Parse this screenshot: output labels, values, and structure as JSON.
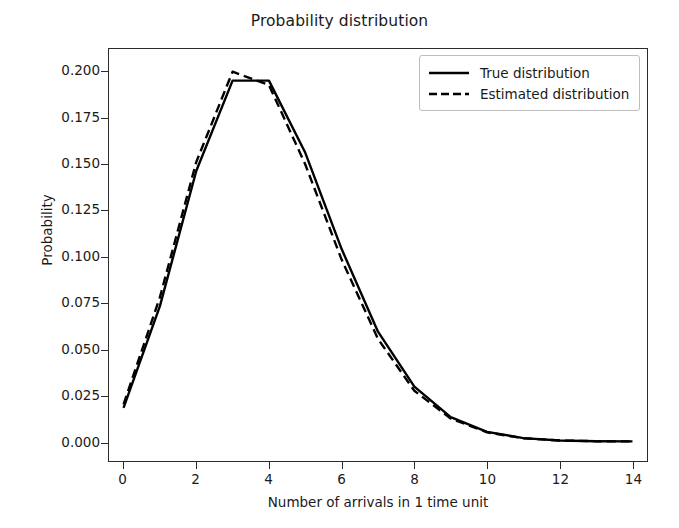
{
  "chart_data": {
    "type": "line",
    "title": "Probability distribution",
    "xlabel": "Number of arrivals in 1 time unit",
    "ylabel": "Probability",
    "xlim": [
      -0.4,
      14.4
    ],
    "ylim": [
      -0.0105,
      0.2125
    ],
    "grid": false,
    "legend_position": "upper right",
    "xticks": [
      0,
      2,
      4,
      6,
      8,
      10,
      12,
      14
    ],
    "xtick_labels": [
      "0",
      "2",
      "4",
      "6",
      "8",
      "10",
      "12",
      "14"
    ],
    "yticks": [
      0.0,
      0.025,
      0.05,
      0.075,
      0.1,
      0.125,
      0.15,
      0.175,
      0.2
    ],
    "ytick_labels": [
      "0.000",
      "0.025",
      "0.050",
      "0.075",
      "0.100",
      "0.125",
      "0.150",
      "0.175",
      "0.200"
    ],
    "x": [
      0,
      1,
      2,
      3,
      4,
      5,
      6,
      7,
      8,
      9,
      10,
      11,
      12,
      13,
      14
    ],
    "series": [
      {
        "name": "True distribution",
        "style": "solid",
        "color": "#000000",
        "values": [
          0.0183,
          0.0733,
          0.1465,
          0.1954,
          0.1954,
          0.1563,
          0.1042,
          0.0595,
          0.0298,
          0.0132,
          0.0053,
          0.0019,
          0.0006,
          0.0002,
          0.0001
        ]
      },
      {
        "name": "Estimated distribution",
        "style": "dashed",
        "color": "#000000",
        "values": [
          0.0202,
          0.0781,
          0.1513,
          0.2002,
          0.193,
          0.15,
          0.0985,
          0.0556,
          0.0275,
          0.0125,
          0.005,
          0.0018,
          0.0006,
          0.0002,
          0.0001
        ]
      }
    ]
  },
  "legend": {
    "entries": [
      {
        "label": "True distribution",
        "style": "solid"
      },
      {
        "label": "Estimated distribution",
        "style": "dashed"
      }
    ]
  }
}
